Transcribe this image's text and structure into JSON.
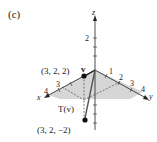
{
  "figure": {
    "panel_label": "(c)",
    "axes": {
      "z_label": "z",
      "y_label": "y",
      "x_label": "x",
      "z_tick": "2",
      "y_ticks": [
        "1",
        "2",
        "3",
        "4"
      ],
      "x_ticks": [
        "3",
        "4"
      ]
    },
    "vectors": {
      "v_label": "v",
      "tv_label": "T(v)"
    },
    "points": {
      "p1": "(3, 2, 2)",
      "p2": "(3, 2, −2)"
    },
    "colors": {
      "plane_fill": "#d4d4d4",
      "axis": "#222222",
      "vector": "#444444"
    }
  }
}
